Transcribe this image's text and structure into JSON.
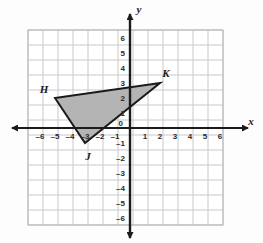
{
  "figure": {
    "kind": "coordinate-plane-triangle",
    "background_color": "#fdfdfd",
    "grid_color": "#c9c9cf",
    "grid_major_color": "#b3b3bb",
    "axis_color": "#1b1b1b",
    "shape_fill_color": "#b0b0b0",
    "shape_stroke_color": "#1a1a1a"
  },
  "axes": {
    "x_axis_name": "x",
    "y_axis_name": "y",
    "origin_label": "0",
    "x_tick_labels": [
      "–6",
      "–5",
      "–4",
      "–3",
      "–2",
      "–1",
      "1",
      "2",
      "3",
      "4",
      "5",
      "6"
    ],
    "y_tick_labels": [
      "6",
      "5",
      "4",
      "3",
      "2",
      "1",
      "–1",
      "–2",
      "–3",
      "–4",
      "–5",
      "–6"
    ],
    "x_tick_values": [
      -6,
      -5,
      -4,
      -3,
      -2,
      -1,
      1,
      2,
      3,
      4,
      5,
      6
    ],
    "y_tick_values": [
      6,
      5,
      4,
      3,
      2,
      1,
      -1,
      -2,
      -3,
      -4,
      -5,
      -6
    ]
  },
  "chart_data": {
    "type": "scatter",
    "title": "",
    "xlabel": "x",
    "ylabel": "y",
    "xlim": [
      -6.5,
      6.5
    ],
    "ylim": [
      -6.5,
      6.5
    ],
    "grid": true,
    "legend": "none",
    "x_ticks": [
      -6,
      -5,
      -4,
      -3,
      -2,
      -1,
      0,
      1,
      2,
      3,
      4,
      5,
      6
    ],
    "y_ticks": [
      -6,
      -5,
      -4,
      -3,
      -2,
      -1,
      0,
      1,
      2,
      3,
      4,
      5,
      6
    ],
    "shapes": [
      {
        "name": "triangle-HJK",
        "type": "polygon",
        "fill": "#b0b0b0",
        "stroke": "#1a1a1a",
        "vertices": [
          {
            "label": "H",
            "x": -5,
            "y": 2
          },
          {
            "label": "J",
            "x": -3,
            "y": -1
          },
          {
            "label": "K",
            "x": 2,
            "y": 3
          }
        ]
      }
    ],
    "annotations": [
      {
        "text": "H",
        "x": -5,
        "y": 2,
        "anchor": "left-above"
      },
      {
        "text": "J",
        "x": -3,
        "y": -1,
        "anchor": "below"
      },
      {
        "text": "K",
        "x": 2,
        "y": 3,
        "anchor": "right-above"
      }
    ]
  }
}
